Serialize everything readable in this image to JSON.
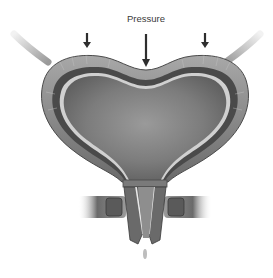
{
  "figure": {
    "labels": {
      "pressure": "Pressure"
    },
    "arrows": [
      {
        "name": "left-pressure-arrow",
        "x": 87,
        "y1": 33,
        "y2": 47
      },
      {
        "name": "center-pressure-arrow",
        "x": 146,
        "y1": 34,
        "y2": 66
      },
      {
        "name": "right-pressure-arrow",
        "x": 205,
        "y1": 33,
        "y2": 47
      }
    ],
    "colors": {
      "outer_wall": "#8a8a8a",
      "muscle_layer": "#4a4a4a",
      "lining": "#cfcfcf",
      "lumen": "#7a7a7a",
      "arrow": "#2e2e2e",
      "background": "#ffffff"
    }
  }
}
